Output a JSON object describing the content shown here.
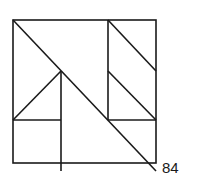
{
  "figure": {
    "label": "84",
    "stroke_color": "#1a1a1a",
    "background": "#ffffff",
    "outer_square": {
      "x": 13,
      "y": 20,
      "size": 143
    },
    "lines": [
      {
        "name": "main-diagonal",
        "x1": 13,
        "y1": 20,
        "x2": 156,
        "y2": 171
      },
      {
        "name": "right-vertical-divider",
        "x1": 108,
        "y1": 20,
        "x2": 108,
        "y2": 120
      },
      {
        "name": "upper-right-diagonal",
        "x1": 108,
        "y1": 20,
        "x2": 156,
        "y2": 71
      },
      {
        "name": "middle-right-diagonal",
        "x1": 108,
        "y1": 71,
        "x2": 156,
        "y2": 120
      },
      {
        "name": "right-horizontal",
        "x1": 108,
        "y1": 120,
        "x2": 156,
        "y2": 120
      },
      {
        "name": "left-triangle-hypotenuse",
        "x1": 13,
        "y1": 120,
        "x2": 61,
        "y2": 71
      },
      {
        "name": "left-vertical-divider",
        "x1": 61,
        "y1": 71,
        "x2": 61,
        "y2": 171
      },
      {
        "name": "left-horizontal",
        "x1": 13,
        "y1": 120,
        "x2": 61,
        "y2": 120
      }
    ]
  }
}
